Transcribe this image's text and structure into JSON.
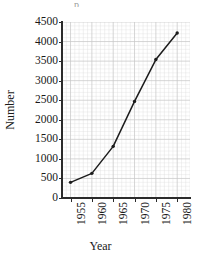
{
  "chart_data": {
    "type": "line",
    "title": "",
    "xlabel": "Year",
    "ylabel": "Number",
    "x": [
      1955,
      1960,
      1965,
      1970,
      1975,
      1980
    ],
    "values": [
      400,
      630,
      1320,
      2470,
      3540,
      4220
    ],
    "series": [
      {
        "name": "Number",
        "values": [
          400,
          630,
          1320,
          2470,
          3540,
          4220
        ]
      }
    ],
    "xlim": [
      1953,
      1983
    ],
    "ylim": [
      0,
      4500
    ],
    "xticks": [
      "1955",
      "1960",
      "1965",
      "1970",
      "1975",
      "1980"
    ],
    "yticks": [
      "0",
      "500",
      "1000",
      "1500",
      "2000",
      "2500",
      "3000",
      "3500",
      "4000",
      "4500"
    ],
    "ytick_values": [
      0,
      500,
      1000,
      1500,
      2000,
      2500,
      3000,
      3500,
      4000,
      4500
    ],
    "grid": true,
    "grid_minor": true,
    "legend": "none",
    "marker": "point",
    "line_color": "#1c1c1c",
    "marker_color": "#1c1c1c",
    "grid_color": "#c8c8c8",
    "grid_minor_color": "#dcdcdc",
    "axis_color": "#2b2b2b",
    "background": "#ffffff"
  },
  "artifact": {
    "top_remnant": "p"
  }
}
